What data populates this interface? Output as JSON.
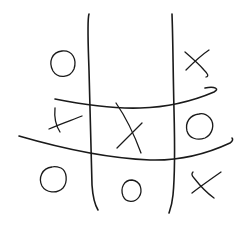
{
  "game": {
    "name": "tic-tac-toe",
    "style": "hand-drawn",
    "ink_color": "#1a1a1a",
    "background_color": "#ffffff",
    "board": [
      [
        "O",
        "",
        "X"
      ],
      [
        "X",
        "X",
        "O"
      ],
      [
        "O",
        "O",
        "X"
      ]
    ]
  }
}
